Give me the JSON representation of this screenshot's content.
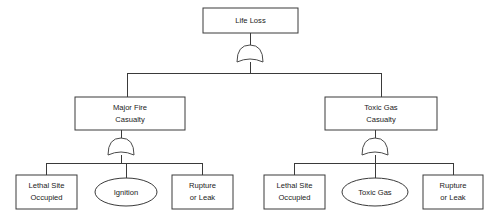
{
  "diagram": {
    "type": "fault-tree",
    "background_color": "#ffffff",
    "line_color": "#3a3a3a",
    "text_color": "#1a1a1a",
    "nodes": {
      "top_event": {
        "label": "Life Loss",
        "shape": "rectangle",
        "lines": [
          "Life Loss"
        ],
        "x": 203,
        "y": 8,
        "w": 95,
        "h": 25
      },
      "major_fire": {
        "label": "Major Fire Casualty",
        "shape": "rectangle",
        "lines": [
          "Major Fire",
          "Casualty"
        ],
        "x": 75,
        "y": 97,
        "w": 110,
        "h": 33
      },
      "toxic_gas_casualty": {
        "label": "Toxic Gas Casualty",
        "shape": "rectangle",
        "lines": [
          "Toxic Gas",
          "Casualty"
        ],
        "x": 325,
        "y": 97,
        "w": 112,
        "h": 33
      },
      "lethal_site_left": {
        "label": "Lethal Site Occupied",
        "shape": "rectangle",
        "lines": [
          "Lethal Site",
          "Occupied"
        ],
        "x": 16,
        "y": 175,
        "w": 61,
        "h": 34
      },
      "ignition": {
        "label": "Ignition",
        "shape": "ellipse",
        "lines": [
          "Ignition"
        ],
        "cx": 126,
        "cy": 192,
        "rx": 31,
        "ry": 14
      },
      "rupture_left": {
        "label": "Rupture or Leak",
        "shape": "rectangle",
        "lines": [
          "Rupture",
          "or Leak"
        ],
        "x": 172,
        "y": 175,
        "w": 61,
        "h": 34
      },
      "lethal_site_right": {
        "label": "Lethal Site Occupied",
        "shape": "rectangle",
        "lines": [
          "Lethal Site",
          "Occupied"
        ],
        "x": 264,
        "y": 175,
        "w": 61,
        "h": 34
      },
      "toxic_gas": {
        "label": "Toxic Gas",
        "shape": "ellipse",
        "lines": [
          "Toxic Gas"
        ],
        "cx": 375,
        "cy": 192,
        "rx": 33,
        "ry": 14
      },
      "rupture_right": {
        "label": "Rupture or Leak",
        "shape": "rectangle",
        "lines": [
          "Rupture",
          "or Leak"
        ],
        "x": 423,
        "y": 175,
        "w": 60,
        "h": 34
      }
    },
    "gates": [
      {
        "name": "top-or-gate",
        "type": "OR",
        "cx": 250,
        "cy": 57
      },
      {
        "name": "major-fire-or-gate",
        "type": "OR",
        "cx": 121,
        "cy": 150
      },
      {
        "name": "toxic-gas-or-gate",
        "type": "OR",
        "cx": 375,
        "cy": 150
      }
    ],
    "labels": {
      "top_event": [
        "Life Loss"
      ],
      "major_fire": [
        "Major Fire",
        "Casualty"
      ],
      "toxic_gas_casualty": [
        "Toxic Gas",
        "Casualty"
      ],
      "lethal_site_left": [
        "Lethal Site",
        "Occupied"
      ],
      "ignition": [
        "Ignition"
      ],
      "rupture_left": [
        "Rupture",
        "or Leak"
      ],
      "lethal_site_right": [
        "Lethal Site",
        "Occupied"
      ],
      "toxic_gas": [
        "Toxic Gas"
      ],
      "rupture_right": [
        "Rupture",
        "or Leak"
      ]
    }
  }
}
